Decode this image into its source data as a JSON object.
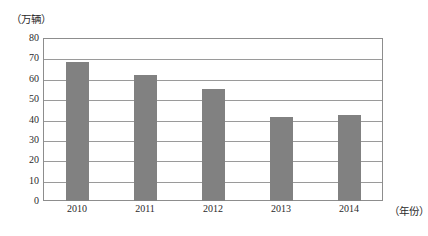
{
  "chart_data": {
    "type": "bar",
    "title": "",
    "subtitle": "",
    "xlabel": "（年份）",
    "ylabel": "（万辆）",
    "categories": [
      "2010",
      "2011",
      "2012",
      "2013",
      "2014"
    ],
    "values": [
      68,
      62,
      55,
      41,
      42
    ],
    "series": [
      {
        "name": "销量",
        "values": [
          68,
          62,
          55,
          41,
          42
        ]
      }
    ],
    "ylim": [
      0,
      80
    ],
    "yticks": [
      0,
      10,
      20,
      30,
      40,
      50,
      60,
      70,
      80
    ],
    "ytick_labels": [
      "0",
      "10",
      "20",
      "30",
      "40",
      "50",
      "60",
      "70",
      "80"
    ],
    "grid": true,
    "grid_axis": "y",
    "legend": false,
    "legend_position": "none",
    "bar_color": "#818181",
    "grid_color": "#9a9a9a",
    "frame_color": "#8d8d8d",
    "text_color": "#2b2b2b",
    "annotations": []
  }
}
